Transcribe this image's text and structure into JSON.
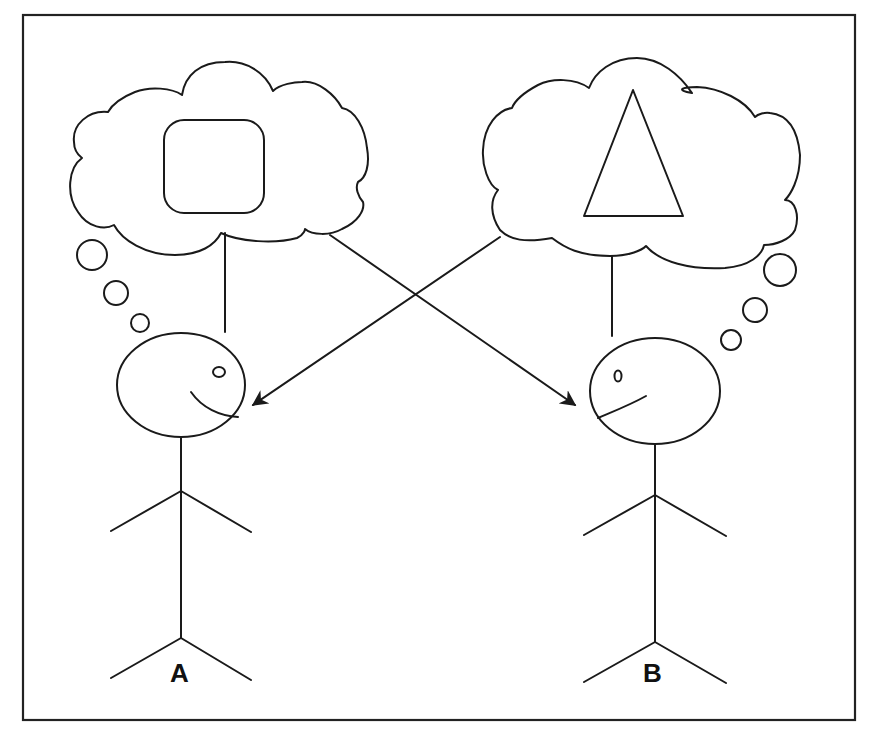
{
  "diagram": {
    "persons": [
      {
        "id": "A",
        "label": "A",
        "thought_shape": "rounded-square"
      },
      {
        "id": "B",
        "label": "B",
        "thought_shape": "triangle"
      }
    ],
    "arrows": [
      {
        "from": "thought-bubble-A",
        "to": "person-B"
      },
      {
        "from": "thought-bubble-B",
        "to": "person-A"
      }
    ],
    "colors": {
      "stroke": "#1a1a1a",
      "background": "#ffffff"
    }
  }
}
